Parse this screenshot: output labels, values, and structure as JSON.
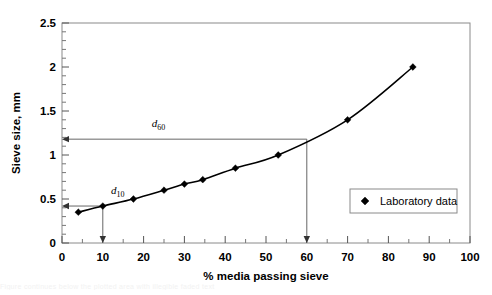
{
  "chart_data": {
    "type": "line",
    "title": "",
    "xlabel": "% media passing sieve",
    "ylabel": "Sieve size, mm",
    "xlim": [
      0,
      100
    ],
    "ylim": [
      0,
      2.5
    ],
    "grid": false,
    "legend_position": "inside-right",
    "x_ticks": [
      "0",
      "10",
      "20",
      "30",
      "40",
      "50",
      "60",
      "70",
      "80",
      "90",
      "100"
    ],
    "x_tick_values": [
      0,
      10,
      20,
      30,
      40,
      50,
      60,
      70,
      80,
      90,
      100
    ],
    "y_ticks": [
      "0",
      "0.5",
      "1",
      "1.5",
      "2",
      "2.5"
    ],
    "y_tick_values": [
      0,
      0.5,
      1,
      1.5,
      2,
      2.5
    ],
    "x_minor_step": 5,
    "y_minor_step": 0.1,
    "series": [
      {
        "name": "Laboratory data",
        "marker": "diamond",
        "color": "#000000",
        "x": [
          4,
          10,
          17.5,
          25,
          30,
          34.5,
          42.5,
          53,
          70,
          86
        ],
        "y": [
          0.35,
          0.42,
          0.5,
          0.6,
          0.67,
          0.72,
          0.85,
          1.0,
          1.4,
          2.0
        ]
      }
    ],
    "annotations": [
      {
        "label": "d",
        "subscript": "60",
        "x_value": 60,
        "y_value": 1.18,
        "style": "crosshair-arrows",
        "label_x": 22,
        "label_y": 1.32
      },
      {
        "label": "d",
        "subscript": "10",
        "x_value": 10,
        "y_value": 0.42,
        "style": "crosshair-arrows",
        "label_x": 12,
        "label_y": 0.56
      }
    ]
  },
  "legend": {
    "entries": [
      {
        "label": "Laboratory data",
        "marker": "diamond-icon"
      }
    ]
  },
  "axes": {
    "x_title": "% media passing sieve",
    "y_title": "Sieve size, mm"
  },
  "footer": {
    "faint_caption": "Figure continues below the plotted area with illegible faded text"
  }
}
